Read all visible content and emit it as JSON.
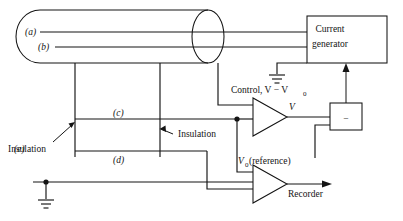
{
  "figure": {
    "type": "electrical-schematic-diagram",
    "background_color": "#ffffff",
    "ink_color": "#141414"
  },
  "vessel": {
    "name": "cylindrical-chamber",
    "shape": "cylinder with rounded left cap and right end ellipse",
    "electrodes": [
      {
        "id": "a",
        "label": "(a)",
        "line_y": 32
      },
      {
        "id": "b",
        "label": "(b)",
        "line_y": 47
      }
    ]
  },
  "internal_elements": [
    {
      "id": "c",
      "label": "(c)"
    },
    {
      "id": "d",
      "label": "(d)"
    }
  ],
  "external_electrode": {
    "id": "e",
    "label": "(e)",
    "grounded": true
  },
  "annotations": {
    "insulation_left": "Insulation",
    "insulation_right": "Insulation",
    "control_signal": "Control, V − V",
    "control_signal_sub": "0",
    "amplifier_out": "V",
    "reference_label": "V",
    "reference_sub": "0",
    "reference_suffix": " (reference)",
    "recorder": "Recorder"
  },
  "blocks": [
    {
      "name": "current-generator",
      "line1": "Current",
      "line2": "generator"
    },
    {
      "name": "difference-amplifier",
      "symbol": "−"
    }
  ],
  "amplifiers": [
    {
      "name": "voltage-follower-amplifier",
      "output_label": "V"
    },
    {
      "name": "recorder-amplifier",
      "output_label": "Recorder"
    }
  ],
  "grounds": [
    {
      "name": "current-generator-ground"
    },
    {
      "name": "electrode-e-ground"
    }
  ]
}
